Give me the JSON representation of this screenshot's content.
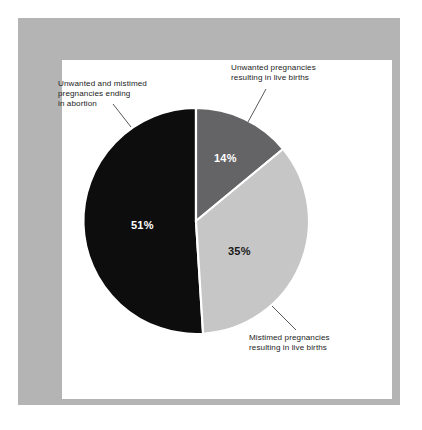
{
  "figure": {
    "frame_color": "#b4b4b4",
    "canvas_color": "#ffffff"
  },
  "chart_data": {
    "type": "pie",
    "title": "",
    "subtitle": "",
    "xlabel": "",
    "ylabel": "",
    "legend_position": "callout-labels",
    "grid": false,
    "unit": "%",
    "categories": [
      "Unwanted and mistimed pregnancies ending in abortion",
      "Unwanted pregnancies resulting in live births",
      "Mistimed pregnancies resulting in live births"
    ],
    "values": [
      51,
      14,
      35
    ],
    "value_labels": [
      "51%",
      "14%",
      "35%"
    ],
    "colors": [
      "#0d0d0d",
      "#646466",
      "#c6c6c6"
    ],
    "slices": [
      {
        "name": "abortion",
        "label_line_1": "Unwanted and mistimed",
        "label_line_2": "pregnancies ending",
        "label_line_3": "in abortion",
        "value": 51,
        "value_label": "51%",
        "color": "#0d0d0d",
        "value_text_color": "#ffffff"
      },
      {
        "name": "unwanted-live-births",
        "label_line_1": "Unwanted pregnancies",
        "label_line_2": "resulting in live births",
        "label_line_3": "",
        "value": 14,
        "value_label": "14%",
        "color": "#646466",
        "value_text_color": "#ffffff"
      },
      {
        "name": "mistimed-live-births",
        "label_line_1": "Mistimed pregnancies",
        "label_line_2": "resulting in live births",
        "label_line_3": "",
        "value": 35,
        "value_label": "35%",
        "color": "#c6c6c6",
        "value_text_color": "#1a1a1a"
      }
    ]
  }
}
